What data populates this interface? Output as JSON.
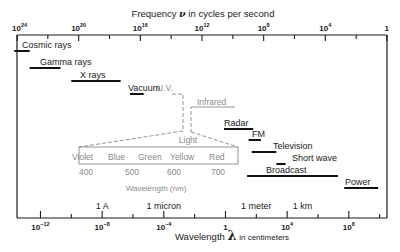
{
  "top_axis": {
    "title_pre": "Frequency",
    "symbol": "ν",
    "title_post": "in cycles per second",
    "ticks": [
      {
        "base": "10",
        "exp": "24",
        "log": 24
      },
      {
        "base": "10",
        "exp": "20",
        "log": 20
      },
      {
        "base": "10",
        "exp": "16",
        "log": 16
      },
      {
        "base": "10",
        "exp": "12",
        "log": 12
      },
      {
        "base": "10",
        "exp": "8",
        "log": 8
      },
      {
        "base": "10",
        "exp": "4",
        "log": 4
      },
      {
        "base": "1",
        "exp": "",
        "log": 0
      }
    ]
  },
  "bottom_axis": {
    "title_pre": "Wavelength",
    "symbol": "λ",
    "title_post": "in centimeters",
    "ticks": [
      {
        "base": "10",
        "exp": "−12",
        "log": -12
      },
      {
        "base": "10",
        "exp": "−8",
        "log": -8
      },
      {
        "base": "10",
        "exp": "−4",
        "log": -4
      },
      {
        "base": "1",
        "exp": "",
        "log": 0
      },
      {
        "base": "10",
        "exp": "4",
        "log": 4
      },
      {
        "base": "10",
        "exp": "8",
        "log": 8
      }
    ],
    "unit_labels": [
      {
        "label": "1 A",
        "log": -8
      },
      {
        "label": "1 micron",
        "log": -4
      },
      {
        "label": "1 meter",
        "log": 2
      },
      {
        "label": "1 km",
        "log": 5
      }
    ]
  },
  "bands": [
    {
      "name": "Cosmic rays",
      "from": -13.7,
      "to": -12.7
    },
    {
      "name": "Gamma rays",
      "from": -12.7,
      "to": -10.7
    },
    {
      "name": "X rays",
      "from": -10.0,
      "to": -6.8
    },
    {
      "name": "Vacuum",
      "from": -6.2,
      "to": -5.3
    },
    {
      "name": "Radar",
      "from": -0.1,
      "to": 1.8
    },
    {
      "name": "FM",
      "from": 1.5,
      "to": 2.3
    },
    {
      "name": "Television",
      "from": 1.7,
      "to": 3.3
    },
    {
      "name": "Short wave",
      "from": 3.3,
      "to": 3.9
    },
    {
      "name": "Broadcast",
      "from": 1.4,
      "to": 7.3
    },
    {
      "name": "Power",
      "from": 7.7,
      "to": 9.9
    }
  ],
  "gray_labels": {
    "uv": "U.V.",
    "infrared": "Infrared",
    "light": "Light"
  },
  "visible_spectrum": {
    "colors": [
      "Violet",
      "Blue",
      "Green",
      "Yellow",
      "Red"
    ],
    "ticks": [
      "400",
      "500",
      "600",
      "700"
    ],
    "axis_label": "Wavelength (nm)"
  }
}
